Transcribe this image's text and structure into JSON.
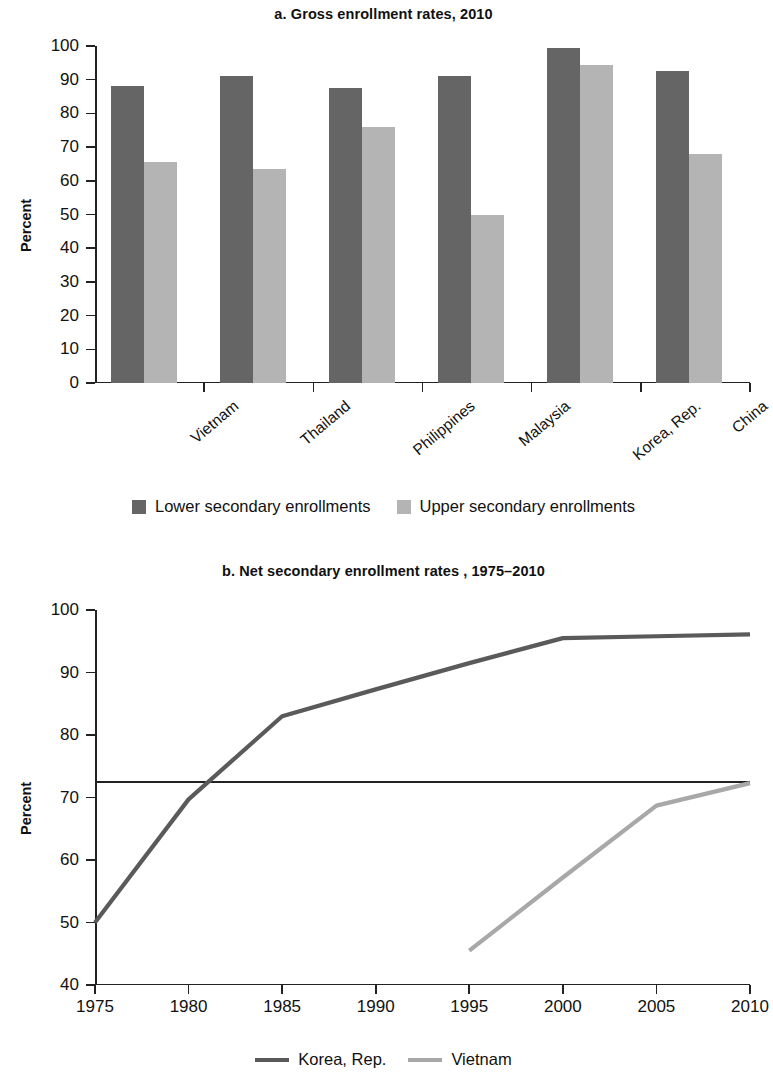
{
  "figure": {
    "panels": [
      {
        "id": "a",
        "title": "a. Gross enrollment rates, 2010",
        "ylabel": "Percent"
      },
      {
        "id": "b",
        "title": "b. Net secondary enrollment rates , 1975–2010",
        "ylabel": "Percent"
      }
    ]
  },
  "colors": {
    "lower_secondary": "#656565",
    "upper_secondary": "#b4b4b4",
    "korea_line": "#5a5a5a",
    "vietnam_line": "#a8a8a8",
    "axis": "#222222"
  },
  "chart_data": [
    {
      "type": "bar",
      "title": "a. Gross enrollment rates, 2010",
      "xlabel": "",
      "ylabel": "Percent",
      "ylim": [
        0,
        100
      ],
      "yticks": [
        0,
        10,
        20,
        30,
        40,
        50,
        60,
        70,
        80,
        90,
        100
      ],
      "ytick_labels": [
        "0",
        "10",
        "20",
        "30",
        "40",
        "50",
        "60",
        "70",
        "80",
        "90",
        "100"
      ],
      "grid": false,
      "legend_position": "bottom",
      "categories": [
        "Vietnam",
        "Thailand",
        "Philippines",
        "Malaysia",
        "Korea, Rep.",
        "China"
      ],
      "series": [
        {
          "name": "Lower secondary enrollments",
          "values": [
            88,
            91,
            87.5,
            91,
            99.5,
            92.5
          ]
        },
        {
          "name": "Upper secondary enrollments",
          "values": [
            65.5,
            63.5,
            76,
            50,
            94.5,
            68
          ]
        }
      ]
    },
    {
      "type": "line",
      "title": "b. Net secondary enrollment rates , 1975–2010",
      "xlabel": "",
      "ylabel": "Percent",
      "ylim": [
        40,
        100
      ],
      "yticks": [
        40,
        50,
        60,
        70,
        80,
        90,
        100
      ],
      "ytick_labels": [
        "40",
        "50",
        "60",
        "70",
        "80",
        "90",
        "100"
      ],
      "xlim": [
        1975,
        2010
      ],
      "xticks": [
        1975,
        1980,
        1985,
        1990,
        1995,
        2000,
        2005,
        2010
      ],
      "xtick_labels": [
        "1975",
        "1980",
        "1985",
        "1990",
        "1995",
        "2000",
        "2005",
        "2010"
      ],
      "grid": false,
      "legend_position": "bottom",
      "reference_line": 72.5,
      "series": [
        {
          "name": "Korea, Rep.",
          "x": [
            1975,
            1980,
            1985,
            1990,
            1995,
            2000,
            2005,
            2010
          ],
          "values": [
            50,
            69.7,
            83,
            87.3,
            91.5,
            95.5,
            95.8,
            96.1
          ]
        },
        {
          "name": "Vietnam",
          "x": [
            1995,
            2000,
            2005,
            2010
          ],
          "values": [
            45.5,
            57.2,
            68.7,
            72.3
          ]
        }
      ]
    }
  ],
  "panel_a": {
    "title": "a. Gross enrollment rates, 2010",
    "ylabel": "Percent",
    "yticks": [
      "100",
      "90",
      "80",
      "70",
      "60",
      "50",
      "40",
      "30",
      "20",
      "10",
      "0"
    ],
    "categories": [
      "Vietnam",
      "Thailand",
      "Philippines",
      "Malaysia",
      "Korea, Rep.",
      "China"
    ],
    "legend": [
      {
        "label": "Lower secondary enrollments",
        "color": "#656565"
      },
      {
        "label": "Upper secondary enrollments",
        "color": "#b4b4b4"
      }
    ]
  },
  "panel_b": {
    "title": "b. Net secondary enrollment rates , 1975–2010",
    "ylabel": "Percent",
    "yticks": [
      "100",
      "90",
      "80",
      "70",
      "60",
      "50",
      "40"
    ],
    "xticks": [
      "1975",
      "1980",
      "1985",
      "1990",
      "1995",
      "2000",
      "2005",
      "2010"
    ],
    "legend": [
      {
        "label": "Korea, Rep.",
        "color": "#5a5a5a"
      },
      {
        "label": "Vietnam",
        "color": "#a8a8a8"
      }
    ]
  }
}
